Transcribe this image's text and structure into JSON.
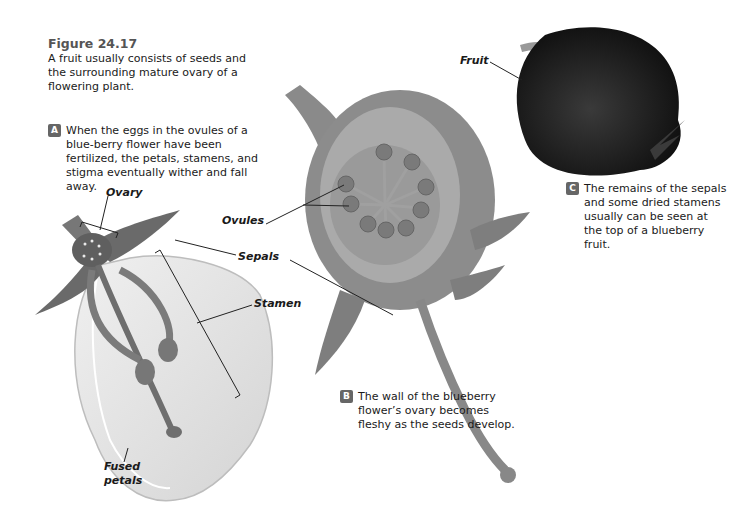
{
  "figure": {
    "number": "Figure 24.17",
    "caption": "A fruit usually consists of seeds and the surrounding mature ovary of a flowering plant."
  },
  "steps": [
    {
      "badge": "A",
      "text": "When the eggs in the ovules of a blue-berry flower have been fertilized, the petals, stamens, and stigma eventually wither and fall away."
    },
    {
      "badge": "B",
      "text": "The wall of the blueberry flower’s ovary becomes fleshy as the seeds develop."
    },
    {
      "badge": "C",
      "text": "The remains of the sepals and some dried stamens usually can be seen at the top of a blueberry fruit."
    }
  ],
  "labels": {
    "ovary": "Ovary",
    "ovules": "Ovules",
    "sepals": "Sepals",
    "stamen": "Stamen",
    "fused_petals_1": "Fused",
    "fused_petals_2": "petals",
    "fruit": "Fruit"
  },
  "colors": {
    "flower_dark": "#6a6a6a",
    "flower_mid": "#8a8a8a",
    "petal_light": "#dcdcdc",
    "fruit": "#1e1e1e"
  }
}
